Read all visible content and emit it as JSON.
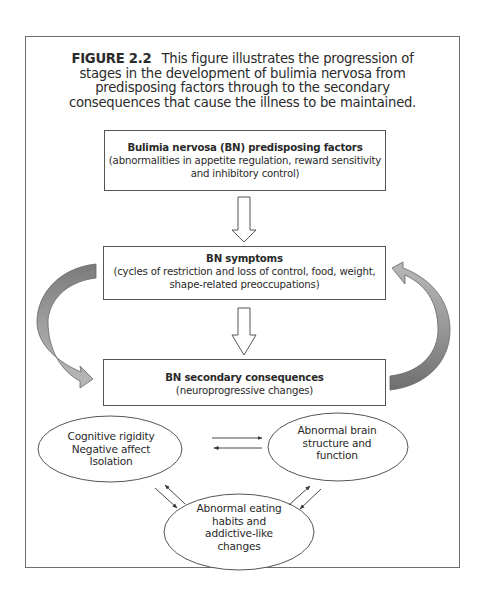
{
  "caption": {
    "label": "FIGURE 2.2",
    "text": "This figure illustrates the progression of stages in the development of bulimia nervosa from predisposing factors through to the secondary consequences that cause the illness to be maintained."
  },
  "boxes": [
    {
      "title": "Bulimia nervosa (BN) predisposing factors",
      "detail": "(abnormalities in appetite regulation, reward sensitivity and inhibitory control)"
    },
    {
      "title": "BN symptoms",
      "detail": "(cycles of restriction and loss of control, food, weight, shape-related preoccupations)"
    },
    {
      "title": "BN secondary consequences",
      "detail": "(neuroprogressive changes)"
    }
  ],
  "ellipses": [
    {
      "lines": [
        "Cognitive rigidity",
        "Negative affect",
        "Isolation"
      ]
    },
    {
      "lines": [
        "Abnormal brain",
        "structure and",
        "function"
      ]
    },
    {
      "lines": [
        "Abnormal eating",
        "habits and",
        "addictive-like",
        "changes"
      ]
    }
  ],
  "colors": {
    "frame": "#6e6e6e",
    "box_border": "#555555",
    "curved_arrow_dark": "#7a7a7a",
    "curved_arrow_light": "#b4b4b4",
    "text": "#2a2a2a"
  }
}
